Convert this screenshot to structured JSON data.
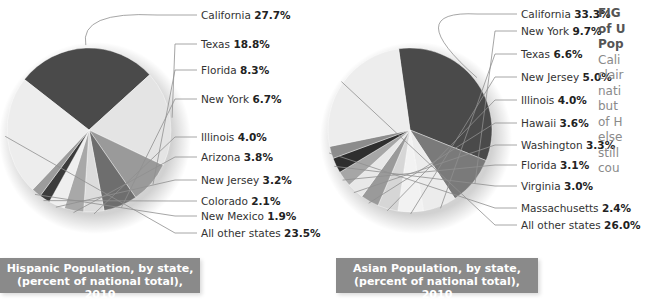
{
  "chart_data": [
    {
      "type": "pie",
      "title": "Hispanic Population, by state, (percent of national total), 2010",
      "caption_line1": "Hispanic Population, by state,",
      "caption_line2": "(percent of national total), 2010",
      "categories": [
        "California",
        "Texas",
        "Florida",
        "New York",
        "Illinois",
        "Arizona",
        "New Jersey",
        "Colorado",
        "New Mexico",
        "All other states"
      ],
      "values": [
        27.7,
        18.8,
        8.3,
        6.7,
        4.0,
        3.8,
        3.2,
        2.1,
        1.9,
        23.5
      ],
      "labels": [
        {
          "name": "California",
          "value": "27.7%"
        },
        {
          "name": "Texas",
          "value": "18.8%"
        },
        {
          "name": "Florida",
          "value": "8.3%"
        },
        {
          "name": "New York",
          "value": "6.7%"
        },
        {
          "name": "Illinois",
          "value": "4.0%"
        },
        {
          "name": "Arizona",
          "value": "3.8%"
        },
        {
          "name": "New Jersey",
          "value": "3.2%"
        },
        {
          "name": "Colorado",
          "value": "2.1%"
        },
        {
          "name": "New Mexico",
          "value": "1.9%"
        },
        {
          "name": "All other states",
          "value": "23.5%"
        }
      ],
      "colors": [
        "#4a4a4a",
        "#e4e4e4",
        "#9a9a9a",
        "#6e6e6e",
        "#dcdcdc",
        "#a8a8a8",
        "#efefef",
        "#3c3c3c",
        "#9c9c9c",
        "#ededed"
      ]
    },
    {
      "type": "pie",
      "title": "Asian Population, by state, (percent of national total), 2010",
      "caption_line1": "Asian Population, by state,",
      "caption_line2": "(percent of national total), 2010",
      "categories": [
        "California",
        "New York",
        "Texas",
        "New Jersey",
        "Illinois",
        "Hawaii",
        "Washington",
        "Florida",
        "Virginia",
        "Massachusetts",
        "All other states"
      ],
      "values": [
        33.3,
        9.7,
        6.6,
        5.0,
        4.0,
        3.6,
        3.3,
        3.1,
        3.0,
        2.4,
        26.0
      ],
      "labels": [
        {
          "name": "California",
          "value": "33.3%"
        },
        {
          "name": "New York",
          "value": "9.7%"
        },
        {
          "name": "Texas",
          "value": "6.6%"
        },
        {
          "name": "New Jersey",
          "value": "5.0%"
        },
        {
          "name": "Illinois",
          "value": "4.0%"
        },
        {
          "name": "Hawaii",
          "value": "3.6%"
        },
        {
          "name": "Washington",
          "value": "3.3%"
        },
        {
          "name": "Florida",
          "value": "3.1%"
        },
        {
          "name": "Virginia",
          "value": "3.0%"
        },
        {
          "name": "Massachusetts",
          "value": "2.4%"
        },
        {
          "name": "All other states",
          "value": "26.0%"
        }
      ],
      "colors": [
        "#4a4a4a",
        "#7a7a7a",
        "#ececec",
        "#f2f2f2",
        "#d6d6d6",
        "#9a9a9a",
        "#e8e8e8",
        "#a6a6a6",
        "#2e2e2e",
        "#8c8c8c",
        "#ededed"
      ]
    }
  ],
  "sidebar_text": {
    "lines": [
      "FIG",
      "of U",
      "Pop",
      "Cali",
      "clair",
      "nati",
      "but",
      "of H",
      "else",
      "still",
      "cou"
    ]
  }
}
